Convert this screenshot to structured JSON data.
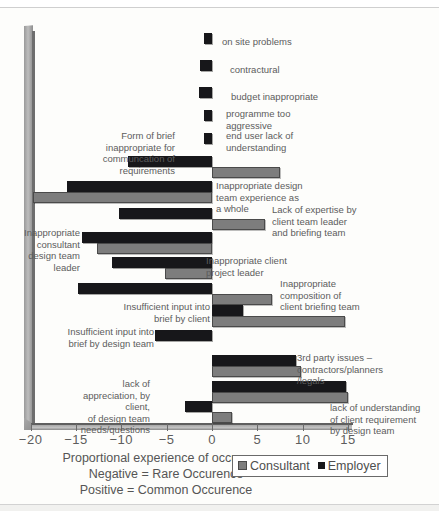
{
  "chart_data": {
    "type": "bar",
    "orientation": "horizontal",
    "title": "",
    "xlabel": "Proportional experience of occurence",
    "ylabel": "",
    "xlim": [
      -20,
      15
    ],
    "xticks": [
      -20,
      -15,
      -10,
      -5,
      0,
      5,
      10,
      15
    ],
    "xticklabels": [
      "−20",
      "−15",
      "−10",
      "−5",
      "0",
      "5",
      "10",
      "15"
    ],
    "grid": false,
    "legend_position": "bottom-right",
    "notes": [
      "Negative  = Rare Occurence",
      "Positive  = Common Occurence"
    ],
    "categories": [
      "on site problems",
      "contractural",
      "budget inappropriate",
      "programme too aggressive",
      "end user lack of understanding",
      "Form of brief inappropriate for communcation of requirements",
      "Inappropriate design team experience as a whole",
      "Lack of expertise by client team leader and briefing team",
      "Inappropriate consultant design team leader",
      "Inappropriate client project leader",
      "Inappropriate composition of client briefing team",
      "Insufficient input into brief by client",
      "Insufficient input into brief  by design team",
      "3rd party issues – contractors/planners /legals",
      "lack of appreciation, by client, of design team needs/questions",
      "lack of understanding of client requirement by design team"
    ],
    "series": [
      {
        "name": "Employer",
        "color": "#17171a",
        "values": [
          -0.9,
          -1.3,
          -1.4,
          -0.9,
          -0.9,
          -9.3,
          -16.0,
          -10.2,
          -14.3,
          -11.0,
          -14.8,
          3.4,
          -6.3,
          9.3,
          14.8,
          -3.0
        ]
      },
      {
        "name": "Consultant",
        "color": "#7d7d7d",
        "values": [
          null,
          null,
          null,
          null,
          null,
          7.5,
          -19.7,
          5.8,
          -12.7,
          -5.2,
          6.6,
          14.7,
          null,
          9.8,
          15.0,
          2.2
        ]
      }
    ]
  },
  "axis": {
    "xlabel": "Proportional experience of occurence",
    "note_negative": "Negative  = Rare Occurence",
    "note_positive": "Positive  = Common Occurence",
    "ticks": [
      "−20",
      "−15",
      "−10",
      "−5",
      "0",
      "5",
      "10",
      "15"
    ]
  },
  "legend": {
    "consultant_label": "Consultant",
    "employer_label": "Employer",
    "consultant_color": "#7d7d7d",
    "employer_color": "#17171a"
  },
  "labels": {
    "on_site_problems": "on site problems",
    "contractural": "contractural",
    "budget_inappropriate": "budget inappropriate",
    "programme_too_aggressive": "programme too\naggressive",
    "end_user_lack": "end user lack of\nunderstanding",
    "form_of_brief": "Form of brief\ninappropriate for\ncommuncation of\nrequirements",
    "inappropriate_design_team": "Inappropriate design\nteam experience as\na whole",
    "lack_of_expertise": "Lack of expertise by\nclient team leader\nand briefing team",
    "inappropriate_consultant": "Inappropriate\nconsultant\ndesign team\nleader",
    "inappropriate_client_pl": "Inappropriate client\nproject leader",
    "inappropriate_composition": "Inappropriate\ncomposition of\nclient briefing team",
    "insufficient_input_client": "Insufficient input into\nbrief by client",
    "insufficient_input_design": "Insufficient input into\nbrief  by design team",
    "third_party": "3rd party issues –\ncontractors/planners\n/legals",
    "lack_of_appreciation": "lack of\nappreciation, by client,\nof design team\nneeds/questions",
    "lack_of_understanding": "lack of understanding\nof client requirement\nby design team"
  }
}
